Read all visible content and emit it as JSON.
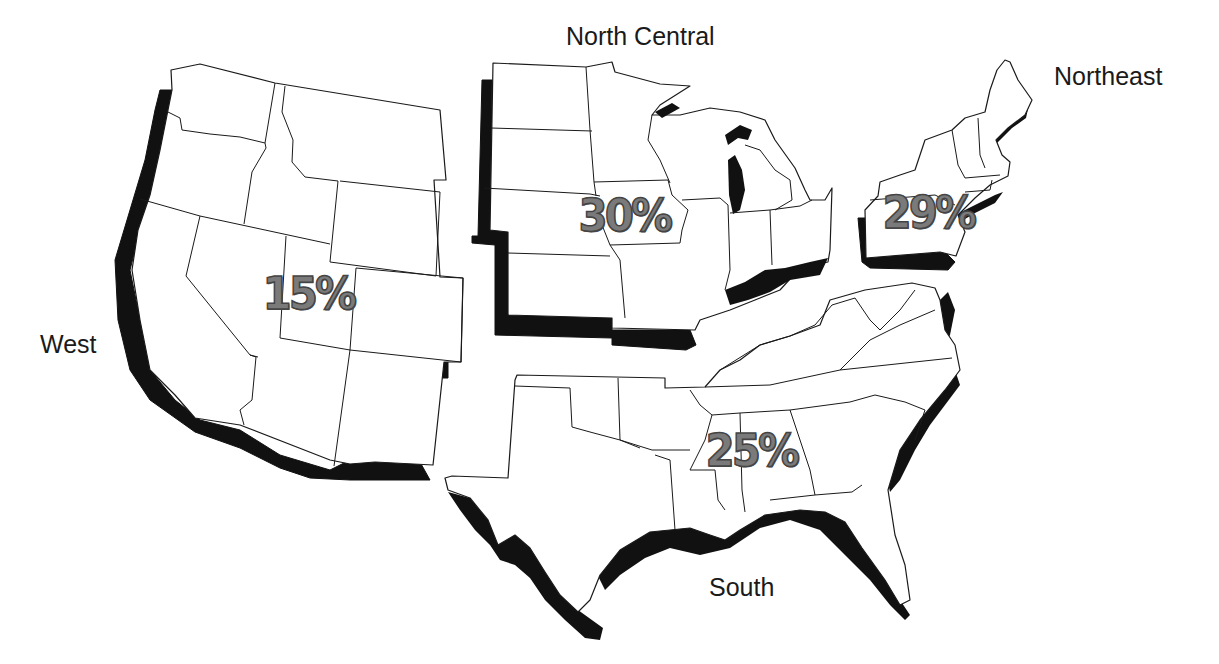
{
  "map": {
    "title": "",
    "regions": [
      {
        "id": "west",
        "name": "West",
        "percent": "15%"
      },
      {
        "id": "north_central",
        "name": "North Central",
        "percent": "30%"
      },
      {
        "id": "northeast",
        "name": "Northeast",
        "percent": "29%"
      },
      {
        "id": "south",
        "name": "South",
        "percent": "25%"
      }
    ],
    "colors": {
      "fill": "#ffffff",
      "outline": "#1a1a1a",
      "shadow": "#111111",
      "percent_text": "#7a7a7a"
    }
  }
}
